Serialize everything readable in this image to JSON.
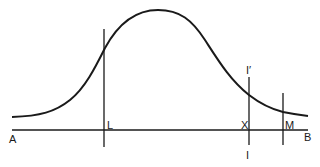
{
  "diagram": {
    "type": "bell-curve-with-markers",
    "labels": {
      "A": "A",
      "B": "B",
      "L": "L",
      "X": "X",
      "M": "M",
      "I_top": "I′",
      "I_bottom": "I"
    },
    "colors": {
      "stroke": "#1a1a1a",
      "background": "#ffffff"
    }
  }
}
